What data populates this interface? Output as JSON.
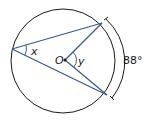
{
  "diagram": {
    "type": "circle-inscribed-central-angle",
    "labels": {
      "inscribed_angle": "x",
      "center": "O",
      "central_angle": "y",
      "arc_measure": "88°"
    },
    "colors": {
      "circle": "#1a1a1a",
      "chords": "#3b5b8c",
      "text": "#1a1a1a"
    }
  }
}
